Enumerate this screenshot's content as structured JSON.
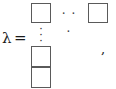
{
  "formula": {
    "variable": "λ",
    "relation": "=",
    "trailing_punctuation": ",",
    "horizontal_ellipsis": "· · ·",
    "vertical_ellipsis_dots": [
      "·",
      "·",
      "·"
    ],
    "cells": [
      {
        "name": "top-left",
        "label": ""
      },
      {
        "name": "top-right",
        "label": ""
      },
      {
        "name": "bottom-upper",
        "label": ""
      },
      {
        "name": "bottom-lower",
        "label": ""
      }
    ]
  },
  "colors": {
    "background": "#ffffff",
    "cell_border": "#5a5a5a",
    "text": "#1a1a1a",
    "dots": "#3a3a3a"
  }
}
